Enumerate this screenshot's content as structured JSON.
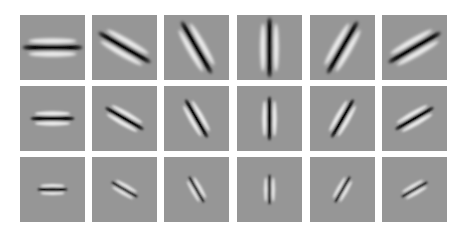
{
  "figure": {
    "background_gray": "#969696",
    "rows": 3,
    "cols": 6,
    "orientations_deg": [
      0,
      30,
      60,
      90,
      120,
      150
    ],
    "scales": [
      {
        "row": 1,
        "length": 30,
        "width": 3.2,
        "lobe_offset": 6.5
      },
      {
        "row": 2,
        "length": 22,
        "width": 2.6,
        "lobe_offset": 5.0
      },
      {
        "row": 3,
        "length": 15,
        "width": 2.0,
        "lobe_offset": 3.8
      }
    ]
  }
}
